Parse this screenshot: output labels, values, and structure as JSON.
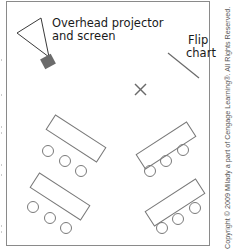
{
  "diagram": {
    "type": "room-layout",
    "labels": {
      "projector_line1": "Overhead projector",
      "projector_line2": "and screen",
      "flipchart_line1": "Flip",
      "flipchart_line2": "chart"
    },
    "copyright": "Copyright © 2009 Milady a part of Cengage Learning®. All Rights Reserved.",
    "colors": {
      "outline": "#7a7a7a",
      "projector": "#6b6b6b",
      "text": "#1a1a1a",
      "border": "#8a8a8a"
    },
    "elements": [
      {
        "id": "projector",
        "kind": "overhead-projector-and-screen"
      },
      {
        "id": "flip-chart",
        "kind": "flip-chart"
      },
      {
        "id": "presenter-position",
        "kind": "x-mark"
      },
      {
        "id": "table-top-left",
        "kind": "table",
        "chairs": 3
      },
      {
        "id": "table-bottom-left",
        "kind": "table",
        "chairs": 3
      },
      {
        "id": "table-top-right",
        "kind": "table",
        "chairs": 3
      },
      {
        "id": "table-bottom-right",
        "kind": "table",
        "chairs": 3
      }
    ]
  }
}
